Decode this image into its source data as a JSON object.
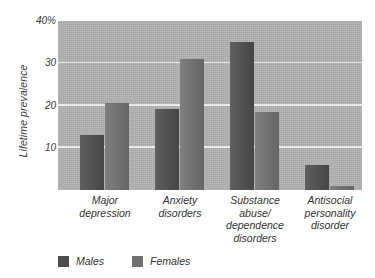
{
  "chart_data": {
    "type": "bar",
    "title": "",
    "subtitle": "",
    "xlabel": "",
    "ylabel": "Lifetime prevalence",
    "ylim": [
      0,
      40
    ],
    "yticks": [
      10,
      20,
      30,
      40
    ],
    "ytick_labels": [
      "10",
      "20",
      "30",
      "40%"
    ],
    "grid": true,
    "legend_position": "bottom-left",
    "categories": [
      "Major depression",
      "Anxiety disorders",
      "Substance abuse/dependence disorders",
      "Antisocial personality disorder"
    ],
    "category_lines": [
      [
        "Major",
        "depression"
      ],
      [
        "Anxiety",
        "disorders"
      ],
      [
        "Substance",
        "abuse/",
        "dependence",
        "disorders"
      ],
      [
        "Antisocial",
        "personality",
        "disorder"
      ]
    ],
    "series": [
      {
        "name": "Males",
        "color": "#4d4d4d",
        "values": [
          13,
          19.2,
          35,
          6
        ]
      },
      {
        "name": "Females",
        "color": "#717171",
        "values": [
          20.5,
          31,
          18.5,
          1
        ]
      }
    ],
    "units": "percent",
    "plot_background": "#b2b2b2",
    "gridline_color": "#f2f2f2"
  },
  "legend": {
    "items": [
      {
        "label": "Males",
        "color": "#4d4d4d"
      },
      {
        "label": "Females",
        "color": "#717171"
      }
    ]
  }
}
